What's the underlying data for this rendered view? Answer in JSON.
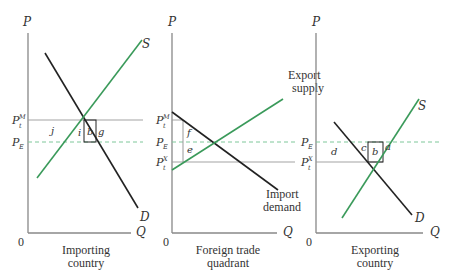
{
  "colors": {
    "axis": "#888888",
    "demand": "#222222",
    "supply": "#3a9a5a",
    "price_line": "#999999",
    "dashed_line": "#7fc79a",
    "box": "#222222",
    "text": "#333333"
  },
  "panels": [
    {
      "id": "importing",
      "caption_line1": "Importing",
      "caption_line2": "country",
      "y_axis_label": "P",
      "x_axis_label": "Q",
      "origin_label": "0",
      "curves": {
        "supply": "S",
        "demand": "D"
      },
      "price_labels": {
        "pm": "P",
        "pm_sub": "t",
        "pm_sup": "M",
        "pe": "P",
        "pe_sub": "E"
      },
      "areas": [
        "j",
        "i",
        "b",
        "g"
      ]
    },
    {
      "id": "foreign-trade",
      "caption_line1": "Foreign trade",
      "caption_line2": "quadrant",
      "y_axis_label": "P",
      "x_axis_label": "Q",
      "origin_label": "0",
      "curves": {
        "supply_line1": "Export",
        "supply_line2": "supply",
        "demand_line1": "Import",
        "demand_line2": "demand"
      },
      "price_labels": {
        "pm": "P",
        "pm_sub": "t",
        "pm_sup": "M",
        "pe": "P",
        "pe_sub": "E",
        "px": "P",
        "px_sub": "t",
        "px_sup": "X"
      },
      "areas": [
        "f",
        "e"
      ]
    },
    {
      "id": "exporting",
      "caption_line1": "Exporting",
      "caption_line2": "country",
      "y_axis_label": "P",
      "x_axis_label": "Q",
      "origin_label": "0",
      "curves": {
        "supply": "S",
        "demand": "D"
      },
      "price_labels": {
        "pe": "P",
        "pe_sub": "E",
        "px": "P",
        "px_sub": "t",
        "px_sup": "X"
      },
      "areas": [
        "d",
        "c",
        "b",
        "a"
      ]
    }
  ]
}
